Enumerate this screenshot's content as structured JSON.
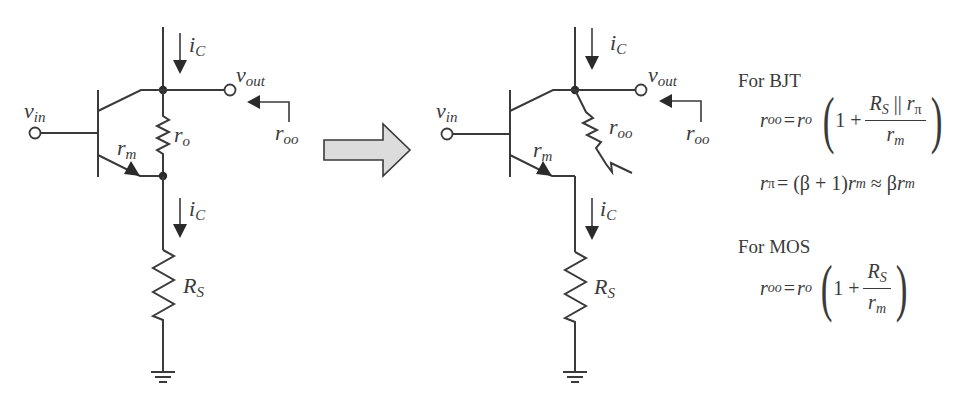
{
  "left_circuit": {
    "labels": {
      "vin": "v",
      "vin_sub": "in",
      "ic_top": "i",
      "ic_top_sub": "C",
      "vout": "v",
      "vout_sub": "out",
      "roo": "r",
      "roo_sub": "oo",
      "ro": "r",
      "ro_sub": "o",
      "rm": "r",
      "rm_sub": "m",
      "ic_bottom": "i",
      "ic_bottom_sub": "C",
      "rs": "R",
      "rs_sub": "S"
    }
  },
  "right_circuit": {
    "labels": {
      "vin": "v",
      "vin_sub": "in",
      "ic_top": "i",
      "ic_top_sub": "C",
      "vout": "v",
      "vout_sub": "out",
      "roo_resistor": "r",
      "roo_resistor_sub": "oo",
      "roo": "r",
      "roo_sub": "oo",
      "rm": "r",
      "rm_sub": "m",
      "ic_bottom": "i",
      "ic_bottom_sub": "C",
      "rs": "R",
      "rs_sub": "S"
    }
  },
  "transform_arrow": {
    "color": "#d9d9d9"
  },
  "equations": {
    "bjt": {
      "heading": "For BJT",
      "roo_lhs": "r",
      "roo_lhs_sub": "oo",
      "eq": "=",
      "ro": "r",
      "ro_sub": "o",
      "one_plus": "1 +",
      "num_rs": "R",
      "num_rs_sub": "S",
      "num_par": " || ",
      "num_rpi": "r",
      "num_rpi_sub": "π",
      "den": "r",
      "den_sub": "m",
      "rpi_lhs": "r",
      "rpi_lhs_sub": "π",
      "rpi_rhs_1": "= (β + 1)",
      "rpi_rhs_rm": "r",
      "rpi_rhs_rm_sub": "m",
      "rpi_approx": " ≈ β",
      "rpi_rhs_rm2": "r",
      "rpi_rhs_rm2_sub": "m"
    },
    "mos": {
      "heading": "For MOS",
      "roo_lhs": "r",
      "roo_lhs_sub": "oo",
      "eq": "=",
      "ro": "r",
      "ro_sub": "o",
      "one_plus": "1 +",
      "num": "R",
      "num_sub": "S",
      "den": "r",
      "den_sub": "m"
    }
  }
}
